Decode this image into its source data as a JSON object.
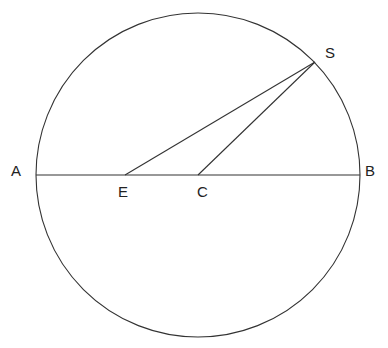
{
  "diagram": {
    "circle": {
      "cx": 198,
      "cy": 175,
      "r": 162
    },
    "points": {
      "A": {
        "label": "A",
        "x": 36,
        "y": 175
      },
      "B": {
        "label": "B",
        "x": 360,
        "y": 175
      },
      "C": {
        "label": "C",
        "x": 198,
        "y": 175
      },
      "E": {
        "label": "E",
        "x": 125,
        "y": 175
      },
      "S": {
        "label": "S",
        "x": 315,
        "y": 62
      }
    },
    "segments": [
      {
        "from": "A",
        "to": "B"
      },
      {
        "from": "E",
        "to": "S"
      },
      {
        "from": "C",
        "to": "S"
      }
    ]
  }
}
